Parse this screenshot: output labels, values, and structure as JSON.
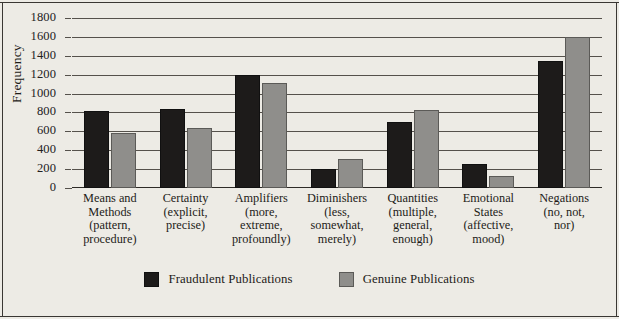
{
  "chart_data": {
    "type": "bar",
    "title": "",
    "subtitle": "",
    "xlabel": "",
    "ylabel": "Frequency",
    "ylim": [
      0,
      1800
    ],
    "ytick_step": 200,
    "yticks": [
      1800,
      1600,
      1400,
      1200,
      1000,
      800,
      600,
      400,
      200,
      0
    ],
    "ytick_labels": [
      "1800",
      "1600",
      "1400",
      "1200",
      "1000",
      "800",
      "600",
      "400",
      "200",
      "0"
    ],
    "grid": true,
    "grid_axis": "y",
    "legend_position": "bottom-center",
    "categories": [
      "Means and Methods (pattern, procedure)",
      "Certainty (explicit, precise)",
      "Amplifiers (more, extreme, profoundly)",
      "Diminishers (less, somewhat, merely)",
      "Quantities (multiple, general, enough)",
      "Emotional States (affective, mood)",
      "Negations (no, not, nor)"
    ],
    "category_lines": [
      [
        "Means and",
        "Methods",
        "(pattern,",
        "procedure)"
      ],
      [
        "Certainty",
        "(explicit,",
        "precise)"
      ],
      [
        "Amplifiers",
        "(more,",
        "extreme,",
        "profoundly)"
      ],
      [
        "Diminishers",
        "(less,",
        "somewhat,",
        "merely)"
      ],
      [
        "Quantities",
        "(multiple,",
        "general,",
        "enough)"
      ],
      [
        "Emotional",
        "States",
        "(affective,",
        "mood)"
      ],
      [
        "Negations",
        "(no, not,",
        "nor)"
      ]
    ],
    "series": [
      {
        "name": "Fraudulent Publications",
        "color": "#1d1b1a",
        "values": [
          820,
          840,
          1195,
          200,
          700,
          255,
          1340
        ]
      },
      {
        "name": "Genuine Publications",
        "color": "#8f8e8b",
        "values": [
          580,
          640,
          1110,
          305,
          825,
          125,
          1595
        ]
      }
    ]
  },
  "legend": {
    "items": [
      {
        "label": "Fraudulent Publications",
        "color": "#1d1b1a"
      },
      {
        "label": "Genuine Publications",
        "color": "#8f8e8b"
      }
    ]
  },
  "style": {
    "background": "#edebe5",
    "axis_color": "#2e2b27",
    "grid_color": "#55514b",
    "text_color": "#1d1b18"
  }
}
